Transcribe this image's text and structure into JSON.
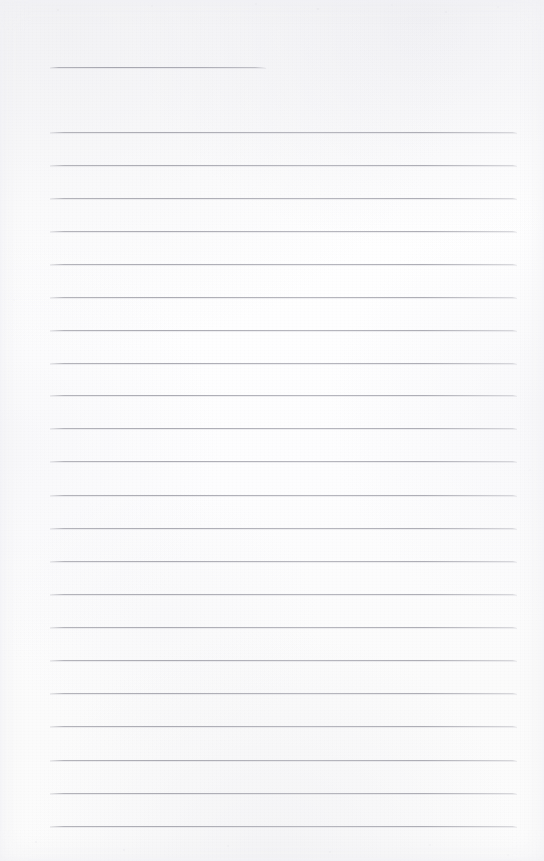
{
  "document": {
    "kind": "scanned-lined-paper",
    "title": "",
    "body_text": "",
    "page_width": 544,
    "page_height": 861,
    "is_blank": true,
    "background_color": "#fdfdfd",
    "rule_color": "#ababb3",
    "rule_thickness": 1,
    "left_margin_x": 50,
    "right_margin_x": 517,
    "line_spacing": 33
  },
  "rules": [
    {
      "label": "title-rule",
      "y": 67,
      "x_start": 50,
      "x_end": 266,
      "short": true
    },
    {
      "label": "rule-1",
      "y": 132,
      "x_start": 50,
      "x_end": 517,
      "short": false
    },
    {
      "label": "rule-2",
      "y": 165,
      "x_start": 50,
      "x_end": 517,
      "short": false
    },
    {
      "label": "rule-3",
      "y": 198,
      "x_start": 50,
      "x_end": 517,
      "short": false
    },
    {
      "label": "rule-4",
      "y": 231,
      "x_start": 50,
      "x_end": 517,
      "short": false
    },
    {
      "label": "rule-5",
      "y": 264,
      "x_start": 50,
      "x_end": 517,
      "short": false
    },
    {
      "label": "rule-6",
      "y": 297,
      "x_start": 50,
      "x_end": 517,
      "short": false
    },
    {
      "label": "rule-7",
      "y": 330,
      "x_start": 50,
      "x_end": 517,
      "short": false
    },
    {
      "label": "rule-8",
      "y": 363,
      "x_start": 50,
      "x_end": 517,
      "short": false
    },
    {
      "label": "rule-9",
      "y": 395,
      "x_start": 50,
      "x_end": 517,
      "short": false
    },
    {
      "label": "rule-10",
      "y": 428,
      "x_start": 50,
      "x_end": 517,
      "short": false
    },
    {
      "label": "rule-11",
      "y": 461,
      "x_start": 50,
      "x_end": 517,
      "short": false
    },
    {
      "label": "rule-12",
      "y": 495,
      "x_start": 50,
      "x_end": 517,
      "short": false
    },
    {
      "label": "rule-13",
      "y": 528,
      "x_start": 50,
      "x_end": 517,
      "short": false
    },
    {
      "label": "rule-14",
      "y": 561,
      "x_start": 50,
      "x_end": 517,
      "short": false
    },
    {
      "label": "rule-15",
      "y": 594,
      "x_start": 50,
      "x_end": 517,
      "short": false
    },
    {
      "label": "rule-16",
      "y": 627,
      "x_start": 50,
      "x_end": 517,
      "short": false
    },
    {
      "label": "rule-17",
      "y": 660,
      "x_start": 50,
      "x_end": 517,
      "short": false
    },
    {
      "label": "rule-18",
      "y": 693,
      "x_start": 50,
      "x_end": 517,
      "short": false
    },
    {
      "label": "rule-19",
      "y": 726,
      "x_start": 50,
      "x_end": 517,
      "short": false
    },
    {
      "label": "rule-20",
      "y": 760,
      "x_start": 50,
      "x_end": 517,
      "short": false
    },
    {
      "label": "rule-21",
      "y": 793,
      "x_start": 50,
      "x_end": 517,
      "short": false
    },
    {
      "label": "rule-22",
      "y": 826,
      "x_start": 50,
      "x_end": 517,
      "short": false
    }
  ]
}
